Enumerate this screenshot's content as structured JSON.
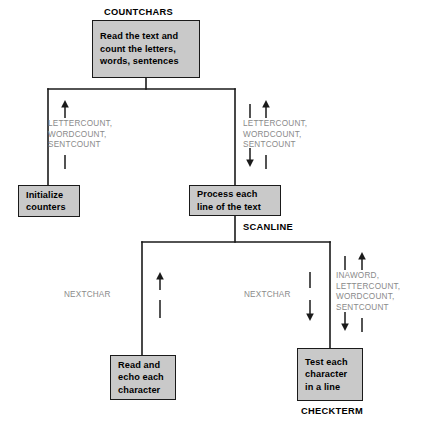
{
  "diagram": {
    "colors": {
      "box_fill": "#c9c9c9",
      "box_border": "#1a1a1a",
      "couple_text": "#8a8a8a",
      "module_label": "#000000",
      "background": "#ffffff"
    }
  },
  "modules": {
    "countchars": {
      "name": "COUNTCHARS",
      "text": "Read the text and\ncount the letters,\nwords, sentences"
    },
    "initialize": {
      "name": "",
      "text": "Initialize\ncounters"
    },
    "scanline": {
      "name": "SCANLINE",
      "text": "Process each\nline of the text"
    },
    "readecho": {
      "name": "",
      "text": "Read and\necho each\ncharacter"
    },
    "checkterm": {
      "name": "CHECKTERM",
      "text": "Test each\ncharacter\nin a line"
    }
  },
  "couples": [
    {
      "id": "init-out",
      "labels": "LETTERCOUNT,\nWORDCOUNT,\nSENTCOUNT",
      "direction": "up",
      "arrows": [
        "up"
      ]
    },
    {
      "id": "scanline-io",
      "labels": "LETTERCOUNT,\nWORDCOUNT,\nSENTCOUNT",
      "direction": "bidirectional",
      "arrows": [
        "down",
        "up"
      ]
    },
    {
      "id": "readecho-out",
      "labels": "NEXTCHAR",
      "direction": "up",
      "arrows": [
        "up"
      ]
    },
    {
      "id": "checkterm-in",
      "labels": "NEXTCHAR",
      "direction": "down",
      "arrows": [
        "down"
      ]
    },
    {
      "id": "checkterm-io",
      "labels": "INAWORD,\nLETTERCOUNT,\nWORDCOUNT,\nSENTCOUNT",
      "direction": "bidirectional",
      "arrows": [
        "down",
        "up"
      ]
    }
  ]
}
